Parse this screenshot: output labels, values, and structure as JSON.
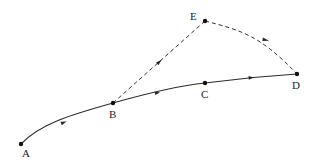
{
  "diagram": {
    "title": "",
    "points": [
      {
        "id": "A",
        "label": "A",
        "x": 21,
        "y": 144,
        "label_x": 24,
        "label_y": 156
      },
      {
        "id": "B",
        "label": "B",
        "x": 113,
        "y": 103,
        "label_x": 109,
        "label_y": 118
      },
      {
        "id": "C",
        "label": "C",
        "x": 205,
        "y": 83,
        "label_x": 201,
        "label_y": 98
      },
      {
        "id": "D",
        "label": "D",
        "x": 297,
        "y": 74,
        "label_x": 292,
        "label_y": 89
      },
      {
        "id": "E",
        "label": "E",
        "x": 205,
        "y": 21,
        "label_x": 190,
        "label_y": 20
      }
    ],
    "edges": [
      {
        "from": "A",
        "to": "B",
        "style": "solid",
        "directed": true,
        "curved": true
      },
      {
        "from": "B",
        "to": "C",
        "style": "solid",
        "directed": true,
        "curved": false
      },
      {
        "from": "C",
        "to": "D",
        "style": "solid",
        "directed": true,
        "curved": false
      },
      {
        "from": "B",
        "to": "E",
        "style": "dashed",
        "directed": true,
        "curved": false
      },
      {
        "from": "E",
        "to": "D",
        "style": "dashed",
        "directed": true,
        "curved": true
      }
    ],
    "labels": {
      "A": "A",
      "B": "B",
      "C": "C",
      "D": "D",
      "E": "E"
    },
    "colors": {
      "background": "#ffffff",
      "stroke": "#2a2a2a",
      "point": "#111111"
    }
  }
}
